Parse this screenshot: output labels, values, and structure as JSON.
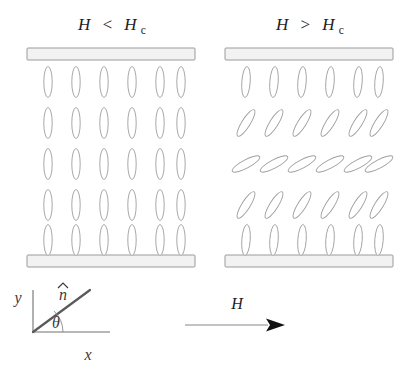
{
  "figure": {
    "background_color": "#ffffff",
    "width": 410,
    "height": 370
  },
  "panels": [
    {
      "id": "below-critical",
      "title_main": "H",
      "title_relation": "<",
      "title_field": "H",
      "title_subscript": "c",
      "title_text": "H < Hc",
      "title_x": 112,
      "title_y": 30,
      "plate_x": 27,
      "plate_width": 168,
      "plate_height": 12,
      "plate_top_y": 48,
      "plate_bottom_y": 255,
      "plate_color": "#f2f2f2",
      "plate_border_color": "#9a9a9a",
      "columns": 6,
      "rows": 5,
      "col_start_x": 48,
      "col_spacing": 28,
      "row_start_y": 82,
      "row_spacing": 41,
      "rod_rx": 4.2,
      "rod_ry": 15.5,
      "row_tilt_degrees": [
        0,
        0,
        0,
        0,
        0
      ]
    },
    {
      "id": "above-critical",
      "title_main": "H",
      "title_relation": ">",
      "title_field": "H",
      "title_subscript": "c",
      "title_text": "H > Hc",
      "title_x": 310,
      "title_y": 30,
      "plate_x": 225,
      "plate_width": 168,
      "plate_height": 12,
      "plate_top_y": 48,
      "plate_bottom_y": 255,
      "plate_color": "#f2f2f2",
      "plate_border_color": "#9a9a9a",
      "columns": 6,
      "rows": 5,
      "col_start_x": 246,
      "col_spacing": 28,
      "row_start_y": 82,
      "row_spacing": 41,
      "rod_rx": 4.2,
      "rod_ry": 15.5,
      "row_tilt_degrees": [
        4,
        32,
        62,
        32,
        4
      ]
    }
  ],
  "legend": {
    "name": "coordinate-frame",
    "origin_x": 33,
    "origin_y": 332,
    "y_axis_label": "y",
    "y_axis_label_x": 18,
    "y_axis_label_y": 300,
    "y_axis_top_y": 290,
    "x_axis_label": "x",
    "x_axis_label_x": 88,
    "x_axis_label_y": 360,
    "x_axis_right_x": 110,
    "director_label": "n",
    "director_hat": "̂",
    "director_label_x": 62,
    "director_label_y": 298,
    "director_end_x": 90,
    "director_end_y": 290,
    "theta_label": "θ",
    "theta_label_x": 58,
    "theta_label_y": 327,
    "theta_arc_radius": 30
  },
  "field_indicator": {
    "name": "magnetic-field-arrow",
    "label": "H",
    "label_x": 237,
    "label_y": 307,
    "line_start_x": 185,
    "line_end_x": 268,
    "line_y": 325,
    "arrow_tip_x": 284,
    "arrow_color": "#111111",
    "line_color": "#888888"
  }
}
